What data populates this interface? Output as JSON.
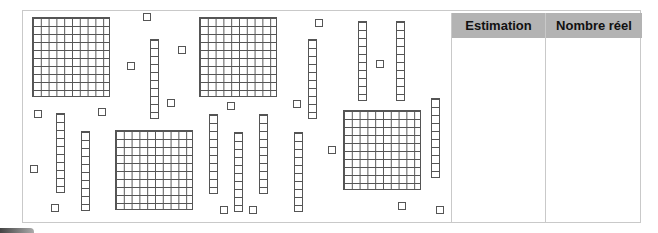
{
  "worksheet": {
    "description": "Base-ten blocks estimation activity",
    "blocks": {
      "flats": [
        {
          "x": 32,
          "y": 17
        },
        {
          "x": 199,
          "y": 17
        },
        {
          "x": 115,
          "y": 130
        },
        {
          "x": 343,
          "y": 110
        }
      ],
      "rods": [
        {
          "x": 150,
          "y": 39
        },
        {
          "x": 56,
          "y": 113
        },
        {
          "x": 81,
          "y": 131
        },
        {
          "x": 209,
          "y": 114
        },
        {
          "x": 234,
          "y": 132
        },
        {
          "x": 259,
          "y": 114
        },
        {
          "x": 294,
          "y": 132
        },
        {
          "x": 308,
          "y": 39
        },
        {
          "x": 358,
          "y": 21
        },
        {
          "x": 396,
          "y": 21
        },
        {
          "x": 431,
          "y": 98
        }
      ],
      "units": [
        {
          "x": 143,
          "y": 13
        },
        {
          "x": 178,
          "y": 46
        },
        {
          "x": 127,
          "y": 62
        },
        {
          "x": 167,
          "y": 99
        },
        {
          "x": 34,
          "y": 110
        },
        {
          "x": 98,
          "y": 108
        },
        {
          "x": 227,
          "y": 102
        },
        {
          "x": 293,
          "y": 100
        },
        {
          "x": 315,
          "y": 19
        },
        {
          "x": 376,
          "y": 60
        },
        {
          "x": 30,
          "y": 165
        },
        {
          "x": 51,
          "y": 204
        },
        {
          "x": 220,
          "y": 206
        },
        {
          "x": 249,
          "y": 206
        },
        {
          "x": 328,
          "y": 146
        },
        {
          "x": 398,
          "y": 202
        },
        {
          "x": 436,
          "y": 206
        }
      ],
      "counts": {
        "flats": 4,
        "rods": 11,
        "units": 17
      }
    },
    "table": {
      "headers": [
        "Estimation",
        "Nombre réel"
      ],
      "values": [
        "",
        ""
      ],
      "header_color": "#b3b3b3"
    }
  }
}
